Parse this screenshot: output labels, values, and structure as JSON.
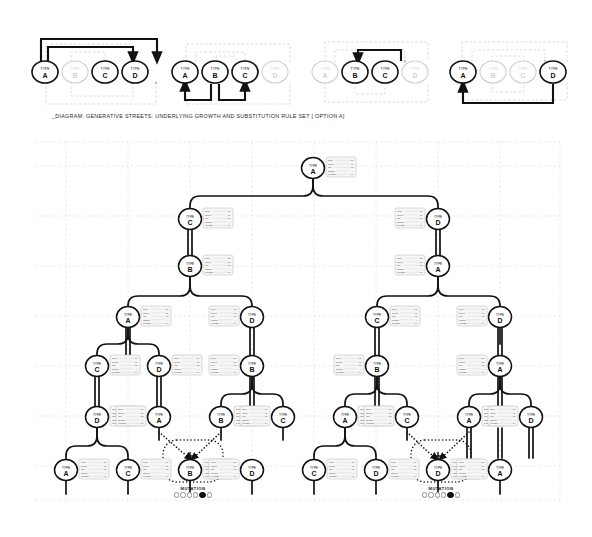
{
  "caption": "_DIAGRAM: GENERATIVE STREETS: UNDERLYING GROWTH AND SUBSTITUTION RULE SET [ OPTION A]",
  "node_type_prefix": "TYPE",
  "rules": {
    "groups": [
      {
        "id": "rule-group-1",
        "nodes": [
          {
            "type": "A",
            "active": true
          },
          {
            "type": "B",
            "active": false
          },
          {
            "type": "C",
            "active": true
          },
          {
            "type": "D",
            "active": true
          }
        ]
      },
      {
        "id": "rule-group-2",
        "nodes": [
          {
            "type": "A",
            "active": true
          },
          {
            "type": "B",
            "active": true
          },
          {
            "type": "C",
            "active": true
          },
          {
            "type": "D",
            "active": false
          }
        ]
      },
      {
        "id": "rule-group-3",
        "nodes": [
          {
            "type": "A",
            "active": false
          },
          {
            "type": "B",
            "active": true
          },
          {
            "type": "C",
            "active": true
          },
          {
            "type": "D",
            "active": false
          }
        ]
      },
      {
        "id": "rule-group-4",
        "nodes": [
          {
            "type": "A",
            "active": true
          },
          {
            "type": "B",
            "active": false
          },
          {
            "type": "C",
            "active": false
          },
          {
            "type": "D",
            "active": true
          }
        ]
      }
    ]
  },
  "mutations": [
    {
      "id": "mutation-left",
      "label": "MUTATION",
      "node_type": "B",
      "steps": 6,
      "active_index": 4
    },
    {
      "id": "mutation-right",
      "label": "MUTATION",
      "node_type": "D",
      "steps": 6,
      "active_index": 4
    }
  ],
  "tree": {
    "root_type": "A",
    "nodes": [
      {
        "id": "n-root",
        "type": "A",
        "x": 313,
        "y": 168,
        "label_side": "right"
      },
      {
        "id": "n-l1",
        "type": "C",
        "x": 190,
        "y": 219,
        "label_side": "right"
      },
      {
        "id": "n-r1",
        "type": "D",
        "x": 438,
        "y": 219,
        "label_side": "left"
      },
      {
        "id": "n-l2",
        "type": "B",
        "x": 190,
        "y": 266,
        "label_side": "right"
      },
      {
        "id": "n-r2",
        "type": "A",
        "x": 438,
        "y": 266,
        "label_side": "left"
      },
      {
        "id": "n-l3a",
        "type": "A",
        "x": 128,
        "y": 317,
        "label_side": "right"
      },
      {
        "id": "n-l3b",
        "type": "D",
        "x": 252,
        "y": 317,
        "label_side": "left"
      },
      {
        "id": "n-r3a",
        "type": "C",
        "x": 377,
        "y": 317,
        "label_side": "right"
      },
      {
        "id": "n-r3b",
        "type": "D",
        "x": 500,
        "y": 317,
        "label_side": "left"
      },
      {
        "id": "n-l4a",
        "type": "C",
        "x": 97,
        "y": 366,
        "label_side": "right"
      },
      {
        "id": "n-l4b",
        "type": "D",
        "x": 159,
        "y": 366,
        "label_side": "right"
      },
      {
        "id": "n-l4c",
        "type": "B",
        "x": 252,
        "y": 366,
        "label_side": "left"
      },
      {
        "id": "n-r4a",
        "type": "B",
        "x": 377,
        "y": 366,
        "label_side": "left"
      },
      {
        "id": "n-r4b",
        "type": "A",
        "x": 500,
        "y": 366,
        "label_side": "left"
      },
      {
        "id": "n-l5a",
        "type": "D",
        "x": 97,
        "y": 417,
        "label_side": "right"
      },
      {
        "id": "n-l5b",
        "type": "A",
        "x": 159,
        "y": 417,
        "label_side": "left"
      },
      {
        "id": "n-l5c",
        "type": "B",
        "x": 221,
        "y": 417,
        "label_side": "right"
      },
      {
        "id": "n-l5d",
        "type": "C",
        "x": 283,
        "y": 417,
        "label_side": "left"
      },
      {
        "id": "n-r5a",
        "type": "A",
        "x": 345,
        "y": 417,
        "label_side": "right"
      },
      {
        "id": "n-r5b",
        "type": "C",
        "x": 407,
        "y": 417,
        "label_side": "left"
      },
      {
        "id": "n-r5c",
        "type": "A",
        "x": 469,
        "y": 417,
        "label_side": "right"
      },
      {
        "id": "n-r5d",
        "type": "D",
        "x": 531,
        "y": 417,
        "label_side": "left"
      },
      {
        "id": "n-l6a",
        "type": "A",
        "x": 66,
        "y": 470,
        "label_side": "right"
      },
      {
        "id": "n-l6b",
        "type": "C",
        "x": 128,
        "y": 470,
        "label_side": "right"
      },
      {
        "id": "n-l6c",
        "type": "B",
        "x": 190,
        "y": 470,
        "label_side": "right"
      },
      {
        "id": "n-l6d",
        "type": "D",
        "x": 252,
        "y": 470,
        "label_side": "left"
      },
      {
        "id": "n-r6a",
        "type": "C",
        "x": 314,
        "y": 470,
        "label_side": "right"
      },
      {
        "id": "n-r6b",
        "type": "D",
        "x": 376,
        "y": 470,
        "label_side": "right"
      },
      {
        "id": "n-r6c",
        "type": "D",
        "x": 438,
        "y": 470,
        "label_side": "right"
      },
      {
        "id": "n-r6d",
        "type": "A",
        "x": 500,
        "y": 470,
        "label_side": "left"
      }
    ]
  },
  "node_label_rows": [
    {
      "key": "Run",
      "value": "01"
    },
    {
      "key": "Seed",
      "value": "07"
    },
    {
      "key": "Iter",
      "value": "03"
    },
    {
      "key": "Origin",
      "value": "A"
    },
    {
      "key": "Length",
      "value": "04"
    }
  ],
  "colors": {
    "stroke": "#111111",
    "faded": "#c9c9c9",
    "grid": "#c8c8c8",
    "label_box": "#f6f6f6",
    "label_border": "#b5b5b5",
    "text": "#111111"
  }
}
